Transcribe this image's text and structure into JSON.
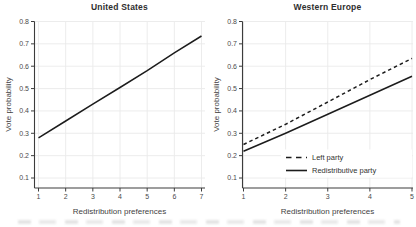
{
  "page": {
    "background": "#ffffff"
  },
  "colors": {
    "series_line": "#1c1c1c",
    "grid": "#eaeaea",
    "axis": "#3c3c3c",
    "tick_label": "#4a4a4a",
    "title": "#2e2e2e",
    "axis_label": "#3f3f3f",
    "legend_text": "#333333",
    "legend_background": "#ffffff"
  },
  "chart_data": [
    {
      "type": "line",
      "title": "United States",
      "xlabel": "Redistribution preferences",
      "ylabel": "Vote probability",
      "x": [
        1,
        2,
        3,
        4,
        5,
        6,
        7
      ],
      "xticks": [
        1,
        2,
        3,
        4,
        5,
        6,
        7
      ],
      "yticks": [
        0.1,
        0.2,
        0.3,
        0.4,
        0.5,
        0.6,
        0.7,
        0.8
      ],
      "xlim": [
        1,
        7
      ],
      "ylim": [
        0.1,
        0.8
      ],
      "grid": true,
      "legend": null,
      "series": [
        {
          "name": "",
          "style": "solid",
          "values": [
            0.28,
            0.355,
            0.43,
            0.505,
            0.58,
            0.66,
            0.735
          ]
        }
      ]
    },
    {
      "type": "line",
      "title": "Western Europe",
      "xlabel": "Redistribution preferences",
      "ylabel": "Vote probability",
      "x": [
        1,
        2,
        3,
        4,
        5
      ],
      "xticks": [
        1,
        2,
        3,
        4,
        5
      ],
      "yticks": [
        0.1,
        0.2,
        0.3,
        0.4,
        0.5,
        0.6,
        0.7,
        0.8
      ],
      "xlim": [
        1,
        5
      ],
      "ylim": [
        0.1,
        0.8
      ],
      "grid": true,
      "legend": {
        "position": "inside-bottom-right"
      },
      "series": [
        {
          "name": "Left party",
          "style": "dashed",
          "values": [
            0.25,
            0.34,
            0.44,
            0.54,
            0.635
          ]
        },
        {
          "name": "Redistributive party",
          "style": "solid",
          "values": [
            0.22,
            0.3,
            0.385,
            0.47,
            0.555
          ]
        }
      ]
    }
  ]
}
